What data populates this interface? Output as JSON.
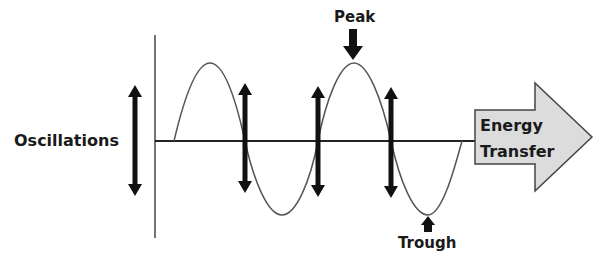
{
  "diagram": {
    "labels": {
      "oscillations": "Oscillations",
      "peak": "Peak",
      "trough": "Trough",
      "energy_line1": "Energy",
      "energy_line2": "Transfer"
    },
    "colors": {
      "ink": "#111111",
      "wave": "#555555",
      "axis": "#333333",
      "arrow_fill": "#dcdcdc",
      "arrow_stroke": "#444444",
      "background": "#ffffff"
    },
    "elements": {
      "oscillation_arrows": 4,
      "wave_cycles": 2
    }
  }
}
